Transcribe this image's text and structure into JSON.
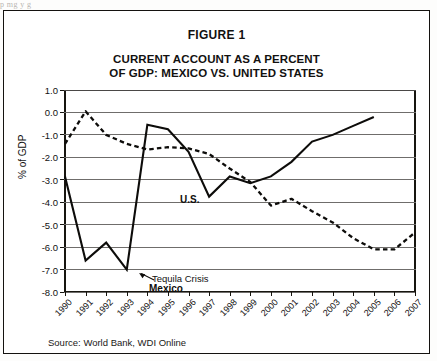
{
  "page": {
    "scan_artifact_text": "p  mg      y                           g"
  },
  "figure": {
    "figure_label": "FIGURE 1",
    "title_line1": "CURRENT ACCOUNT AS A PERCENT",
    "title_line2": "OF GDP: MEXICO VS. UNITED STATES",
    "source": "Source: World Bank, WDI Online"
  },
  "labels": {
    "us_series": "U.S.",
    "mexico_series": "Mexico",
    "tequila_annotation": "Tequila Crisis"
  },
  "colors": {
    "line": "#0d0c0a",
    "grid": "#6f6d6b",
    "frame": "#14120f",
    "background": "#ffffff"
  },
  "chart_data": {
    "type": "line",
    "title": "CURRENT ACCOUNT AS A PERCENT OF GDP: MEXICO VS. UNITED STATES",
    "subtitle": "FIGURE 1",
    "xlabel": "",
    "ylabel": "% of GDP",
    "ylim": [
      -8.0,
      1.0
    ],
    "ytick_step": 1.0,
    "ytick_labels": [
      "1.0",
      "0.0",
      "-1.0",
      "-2.0",
      "-3.0",
      "-4.0",
      "-5.0",
      "-6.0",
      "-7.0",
      "-8.0"
    ],
    "ytick_values": [
      1.0,
      0.0,
      -1.0,
      -2.0,
      -3.0,
      -4.0,
      -5.0,
      -6.0,
      -7.0,
      -8.0
    ],
    "grid": true,
    "grid_axis": "y",
    "legend": "inline-labels",
    "x": [
      1990,
      1991,
      1992,
      1993,
      1994,
      1995,
      1996,
      1997,
      1998,
      1999,
      2000,
      2001,
      2002,
      2003,
      2004,
      2005,
      2006,
      2007
    ],
    "xtick_labels": [
      "1990",
      "1991",
      "1992",
      "1993",
      "1994",
      "1995",
      "1996",
      "1997",
      "1998",
      "1999",
      "2000",
      "2001",
      "2002",
      "2003",
      "2004",
      "2005",
      "2006",
      "2007"
    ],
    "series": [
      {
        "name": "Mexico",
        "style": "solid",
        "x": [
          1990,
          1991,
          1992,
          1993,
          1994,
          1995,
          1996,
          1997,
          1998,
          1999,
          2000,
          2001,
          2002,
          2003,
          2004,
          2005
        ],
        "values": [
          -2.85,
          -6.6,
          -5.8,
          -7.0,
          -0.55,
          -0.75,
          -1.75,
          -3.75,
          -2.85,
          -3.15,
          -2.85,
          -2.2,
          -1.3,
          -1.0,
          -0.6,
          -0.2
        ]
      },
      {
        "name": "U.S.",
        "style": "dashed",
        "x": [
          1990,
          1991,
          1992,
          1993,
          1994,
          1995,
          1996,
          1997,
          1998,
          1999,
          2000,
          2001,
          2002,
          2003,
          2004,
          2005,
          2006,
          2007
        ],
        "values": [
          -1.4,
          0.05,
          -1.0,
          -1.4,
          -1.65,
          -1.55,
          -1.6,
          -1.85,
          -2.5,
          -3.1,
          -4.15,
          -3.85,
          -4.4,
          -4.9,
          -5.6,
          -6.1,
          -6.1,
          -5.35
        ]
      }
    ],
    "annotations": [
      {
        "text": "Tequila Crisis",
        "points_to_x": 1993.6,
        "points_to_y": -7.0
      }
    ]
  }
}
